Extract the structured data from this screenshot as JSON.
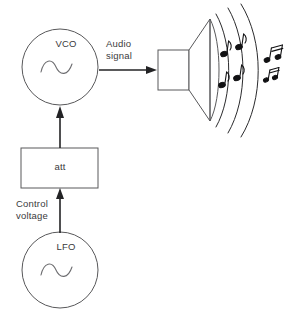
{
  "diagram": {
    "colors": {
      "background": "#ffffff",
      "outline": "#58585a",
      "arrow": "#232325",
      "text": "#3a3a3c",
      "note": "#111113",
      "wave": "#6d6d70"
    },
    "nodes": {
      "vco": {
        "label": "VCO",
        "shape": "circle",
        "contains_icon": "sine-wave-icon",
        "cx": 60,
        "cy": 67,
        "r": 38
      },
      "att": {
        "label": "att",
        "shape": "rectangle",
        "x": 21,
        "y": 148,
        "width": 77,
        "height": 40
      },
      "lfo": {
        "label": "LFO",
        "shape": "circle",
        "contains_icon": "sine-wave-icon",
        "cx": 60,
        "cy": 270,
        "r": 38
      },
      "speaker": {
        "label": "",
        "shape": "loudspeaker",
        "icon": "speaker-icon"
      }
    },
    "connections": [
      {
        "name": "lfo-to-att",
        "label": "Control\nvoltage",
        "from": "lfo",
        "to": "att",
        "direction": "up"
      },
      {
        "name": "att-to-vco",
        "label": "",
        "from": "att",
        "to": "vco",
        "direction": "up"
      },
      {
        "name": "vco-to-speaker",
        "label": "Audio\nsignal",
        "from": "vco",
        "to": "speaker",
        "direction": "right"
      }
    ],
    "sound_waves": {
      "arc_count": 3,
      "note_count": 6,
      "description": "concentric sound arcs radiating from speaker with musical notes"
    }
  }
}
